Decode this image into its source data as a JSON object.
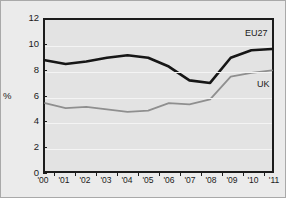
{
  "chart_data": {
    "type": "line",
    "title": "",
    "xlabel": "",
    "ylabel": "%",
    "ylim": [
      0,
      12
    ],
    "yticks": [
      0,
      2,
      4,
      6,
      8,
      10,
      12
    ],
    "grid": true,
    "legend_position": "inline-right",
    "categories": [
      "'00",
      "'01",
      "'02",
      "'03",
      "'04",
      "'05",
      "'06",
      "'07",
      "'08",
      "'09",
      "'10",
      "'11"
    ],
    "x": [
      2000,
      2001,
      2002,
      2003,
      2004,
      2005,
      2006,
      2007,
      2008,
      2009,
      2010,
      2011
    ],
    "series": [
      {
        "name": "EU27",
        "color": "#161616",
        "values": [
          8.8,
          8.5,
          8.7,
          9.0,
          9.2,
          9.0,
          8.3,
          7.2,
          7.0,
          9.0,
          9.6,
          9.7
        ]
      },
      {
        "name": "UK",
        "color": "#8f8f8f",
        "values": [
          5.4,
          5.0,
          5.1,
          4.9,
          4.7,
          4.8,
          5.4,
          5.3,
          5.7,
          7.5,
          7.8,
          8.0
        ]
      }
    ]
  },
  "axes": {
    "y_title": "%",
    "ytick_labels": [
      "0",
      "2",
      "4",
      "6",
      "8",
      "10",
      "12"
    ],
    "xtick_labels": [
      "'00",
      "'01",
      "'02",
      "'03",
      "'04",
      "'05",
      "'06",
      "'07",
      "'08",
      "'09",
      "'10",
      "'11"
    ]
  },
  "annotations": {
    "eu27_label": "EU27",
    "uk_label": "UK"
  },
  "colors": {
    "background": "#ebebeb",
    "plot_background": "#e3e3e3",
    "axis": "#1c1c1c",
    "gridline": "#f4f4f4",
    "eu27": "#161616",
    "uk": "#8f8f8f"
  }
}
